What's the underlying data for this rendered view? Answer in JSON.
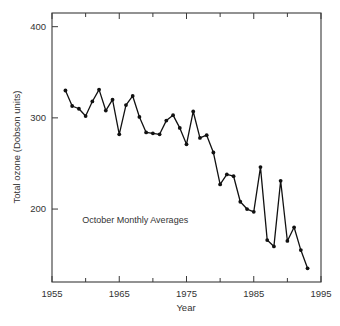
{
  "chart_data": {
    "type": "line",
    "title": "",
    "subtitle": "",
    "xlabel": "Year",
    "ylabel": "Total ozone (Dobson units)",
    "xlim": [
      1955,
      1995
    ],
    "ylim": [
      120,
      415
    ],
    "grid": false,
    "legend": false,
    "legend_position": "none",
    "xticks_major": [
      1955,
      1965,
      1975,
      1985,
      1995
    ],
    "xticks_minor": [
      1960,
      1970,
      1980,
      1990
    ],
    "xtick_labels": [
      "1955",
      "1965",
      "1975",
      "1985",
      "1995"
    ],
    "yticks_major": [
      200,
      300,
      400
    ],
    "ytick_labels": [
      "200",
      "300",
      "400"
    ],
    "annotations": [
      {
        "text": "October Monthly Averages",
        "x": 1959.5,
        "y": 185
      }
    ],
    "series": [
      {
        "name": "Total ozone",
        "marker": "filled-circle",
        "color": "#111111",
        "x": [
          1957,
          1958,
          1959,
          1960,
          1961,
          1962,
          1963,
          1964,
          1965,
          1966,
          1967,
          1968,
          1969,
          1970,
          1971,
          1972,
          1973,
          1974,
          1975,
          1976,
          1977,
          1978,
          1979,
          1980,
          1981,
          1982,
          1983,
          1984,
          1985,
          1986,
          1987,
          1988,
          1989,
          1990,
          1991,
          1992,
          1993
        ],
        "values": [
          330,
          313,
          310,
          302,
          318,
          331,
          308,
          320,
          282,
          314,
          324,
          301,
          284,
          283,
          282,
          297,
          303,
          289,
          271,
          307,
          278,
          281,
          262,
          227,
          238,
          236,
          208,
          200,
          197,
          246,
          166,
          159,
          231,
          165,
          180,
          155,
          135
        ]
      }
    ]
  }
}
